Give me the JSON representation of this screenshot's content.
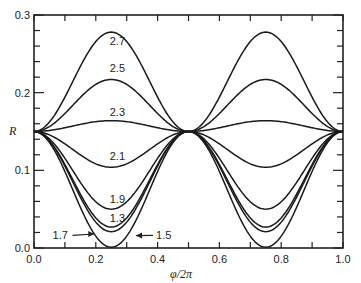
{
  "chart_data": {
    "type": "line",
    "title": "",
    "xlabel": "φ/2π",
    "ylabel": "R",
    "xlim": [
      0.0,
      1.0
    ],
    "ylim": [
      0.0,
      0.3
    ],
    "x_ticks": [
      "0.0",
      "0.2",
      "0.4",
      "0.6",
      "0.8",
      "1.0"
    ],
    "y_ticks": [
      "0.0",
      "0.1",
      "0.2",
      "0.3"
    ],
    "x_minor_step": 0.1,
    "y_minor_step": 0.02,
    "grid": false,
    "legend": "inline curve labels",
    "series_model": "R = 0.15 + A * sin^2(2*pi*x)",
    "series": [
      {
        "name": "2.7",
        "amplitude": 0.128,
        "min_or_max": 0.278,
        "label_pos": [
          0.245,
          0.262
        ]
      },
      {
        "name": "2.5",
        "amplitude": 0.067,
        "min_or_max": 0.217,
        "label_pos": [
          0.245,
          0.226
        ]
      },
      {
        "name": "2.3",
        "amplitude": 0.014,
        "min_or_max": 0.164,
        "label_pos": [
          0.245,
          0.17
        ]
      },
      {
        "name": "2.1",
        "amplitude": -0.046,
        "min_or_max": 0.104,
        "label_pos": [
          0.245,
          0.113
        ]
      },
      {
        "name": "1.9",
        "amplitude": -0.1,
        "min_or_max": 0.05,
        "label_pos": [
          0.245,
          0.058
        ]
      },
      {
        "name": "1.3",
        "amplitude": -0.123,
        "min_or_max": 0.027,
        "label_pos": [
          0.245,
          0.034
        ]
      },
      {
        "name": "1.5",
        "amplitude": -0.129,
        "min_or_max": 0.021,
        "label_pos": [
          0.395,
          0.011
        ]
      },
      {
        "name": "1.7",
        "amplitude": -0.149,
        "min_or_max": 0.001,
        "label_pos": [
          0.06,
          0.011
        ]
      }
    ],
    "annotations": [
      {
        "text": "1.7",
        "arrow_to": [
          0.195,
          0.018
        ]
      },
      {
        "text": "1.5",
        "arrow_to": [
          0.33,
          0.016
        ]
      }
    ]
  }
}
